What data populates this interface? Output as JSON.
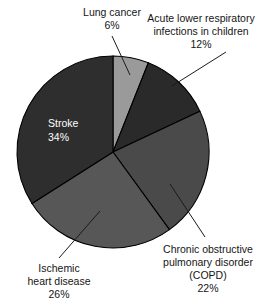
{
  "chart_data": {
    "type": "pie",
    "title": "",
    "subtitle": "",
    "xlabel": "",
    "ylabel": "",
    "legend_position": "none",
    "grid": false,
    "units": "percent",
    "total": 100,
    "start_angle_deg": 0,
    "direction": "clockwise",
    "categories": [
      "Lung cancer",
      "Acute lower respiratory infections in children",
      "Chronic obstructive pulmonary disorder (COPD)",
      "Ischemic heart disease",
      "Stroke"
    ],
    "values": [
      6,
      12,
      22,
      26,
      34
    ],
    "slices": [
      {
        "id": "lung-cancer",
        "name": "Lung cancer",
        "value": 6,
        "value_label": "6%",
        "color": "#9a9a9a",
        "label_lines": [
          "Lung cancer",
          "6%"
        ],
        "label_position": "outside-top",
        "text_color": "#151515"
      },
      {
        "id": "acute-lower-respiratory",
        "name": "Acute lower respiratory infections in children",
        "value": 12,
        "value_label": "12%",
        "color": "#2a2a2a",
        "label_lines": [
          "Acute lower respiratory",
          "infections in children",
          "12%"
        ],
        "label_position": "outside-top-right",
        "text_color": "#151515"
      },
      {
        "id": "copd",
        "name": "Chronic obstructive pulmonary disorder (COPD)",
        "value": 22,
        "value_label": "22%",
        "color": "#4a4a4a",
        "label_lines": [
          "Chronic obstructive",
          "pulmonary disorder",
          "(COPD)",
          "22%"
        ],
        "label_position": "outside-bottom-right",
        "text_color": "#151515"
      },
      {
        "id": "ischemic-heart-disease",
        "name": "Ischemic heart disease",
        "value": 26,
        "value_label": "26%",
        "color": "#575757",
        "label_lines": [
          "Ischemic",
          "heart disease",
          "26%"
        ],
        "label_position": "outside-bottom-left",
        "text_color": "#151515"
      },
      {
        "id": "stroke",
        "name": "Stroke",
        "value": 34,
        "value_label": "34%",
        "color": "#2e2e2e",
        "label_lines": [
          "Stroke",
          "34%"
        ],
        "label_position": "inside",
        "text_color": "#ffffff"
      }
    ]
  },
  "labels": {
    "lung_cancer": {
      "line1": "Lung cancer",
      "line2": "6%"
    },
    "acute_lri": {
      "line1": "Acute lower respiratory",
      "line2": "infections in children",
      "line3": "12%"
    },
    "copd": {
      "line1": "Chronic obstructive",
      "line2": "pulmonary disorder",
      "line3": "(COPD)",
      "line4": "22%"
    },
    "ischemic": {
      "line1": "Ischemic",
      "line2": "heart disease",
      "line3": "26%"
    },
    "stroke": {
      "line1": "Stroke",
      "line2": "34%"
    }
  },
  "geometry": {
    "center_x": 113,
    "center_y": 152,
    "radius": 96
  },
  "colors": {
    "background": "#ffffff",
    "outline": "#000000",
    "text": "#151515",
    "inside_text": "#ffffff"
  }
}
